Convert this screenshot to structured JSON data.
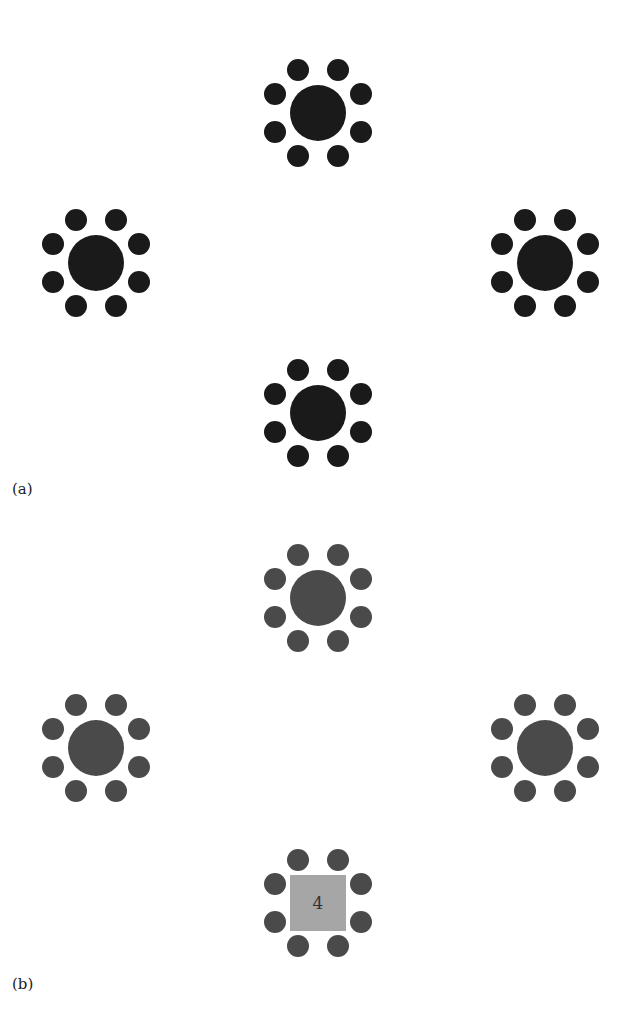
{
  "figure": {
    "panels": [
      {
        "label": "(a)",
        "label_pos": [
          12,
          494
        ],
        "table_color": "#1a1a1a",
        "seat_color": "#1a1a1a",
        "tables": [
          {
            "id": "a-top",
            "shape": "circle",
            "cx": 318,
            "cy": 113,
            "seats": 8
          },
          {
            "id": "a-left",
            "shape": "circle",
            "cx": 96,
            "cy": 263,
            "seats": 8
          },
          {
            "id": "a-right",
            "shape": "circle",
            "cx": 545,
            "cy": 263,
            "seats": 8
          },
          {
            "id": "a-bottom",
            "shape": "circle",
            "cx": 318,
            "cy": 413,
            "seats": 8
          }
        ]
      },
      {
        "label": "(b)",
        "label_pos": [
          12,
          989
        ],
        "table_color": "#4a4a4a",
        "seat_color": "#4a4a4a",
        "tables": [
          {
            "id": "b-top",
            "shape": "circle",
            "cx": 318,
            "cy": 598,
            "seats": 8
          },
          {
            "id": "b-left",
            "shape": "circle",
            "cx": 96,
            "cy": 748,
            "seats": 8
          },
          {
            "id": "b-right",
            "shape": "circle",
            "cx": 545,
            "cy": 748,
            "seats": 8
          },
          {
            "id": "b-bottom",
            "shape": "square",
            "cx": 318,
            "cy": 903,
            "seats": 8,
            "fill": "#a6a6a6",
            "number": "4"
          }
        ]
      }
    ],
    "geometry": {
      "table_radius": 28,
      "square_half": 28,
      "seat_radius": 11,
      "seat_offsets": [
        [
          -20,
          -43
        ],
        [
          20,
          -43
        ],
        [
          43,
          -19
        ],
        [
          43,
          19
        ],
        [
          20,
          43
        ],
        [
          -20,
          43
        ],
        [
          -43,
          19
        ],
        [
          -43,
          -19
        ]
      ]
    }
  }
}
